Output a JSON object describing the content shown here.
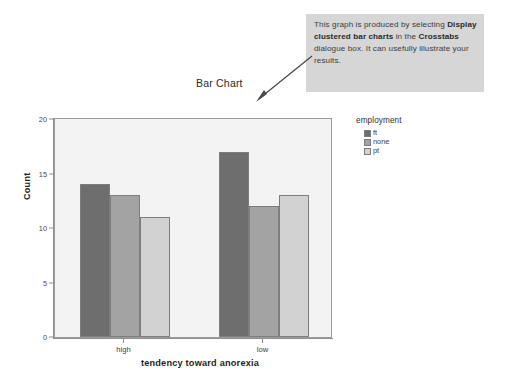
{
  "annotation": {
    "segments": [
      {
        "text": "This graph is produced by selecting ",
        "bold": false
      },
      {
        "text": "Display clustered bar charts",
        "bold": true
      },
      {
        "text": " in the ",
        "bold": false
      },
      {
        "text": "Crosstabs",
        "bold": true
      },
      {
        "text": " dialogue box. It can usefully illustrate your results.",
        "bold": false
      }
    ],
    "plain_text": "This graph is produced by selecting Display clustered bar charts in the Crosstabs dialogue box. It can usefully illustrate your results.",
    "background_color": "#d6d6d6",
    "arrow": "arrow pointing down-left to chart title"
  },
  "chart_data": {
    "type": "bar",
    "title": "Bar Chart",
    "xlabel": "tendency toward anorexia",
    "ylabel": "Count",
    "categories": [
      "high",
      "low"
    ],
    "series": [
      {
        "name": "ft",
        "values": [
          14,
          17
        ],
        "color": "#6e6e6e"
      },
      {
        "name": "none",
        "values": [
          13,
          12
        ],
        "color": "#a3a3a3"
      },
      {
        "name": "pt",
        "values": [
          11,
          13
        ],
        "color": "#d2d2d2"
      }
    ],
    "legend_title": "employment",
    "legend_position": "right",
    "ylim": [
      0,
      20
    ],
    "yticks": [
      0,
      5,
      10,
      15,
      20
    ],
    "ytick_labels": [
      "0",
      "5",
      "10",
      "15",
      "20"
    ],
    "grid": false,
    "plot_background": "#f3f3f3",
    "bar_border_color": "#7d7d7d"
  }
}
